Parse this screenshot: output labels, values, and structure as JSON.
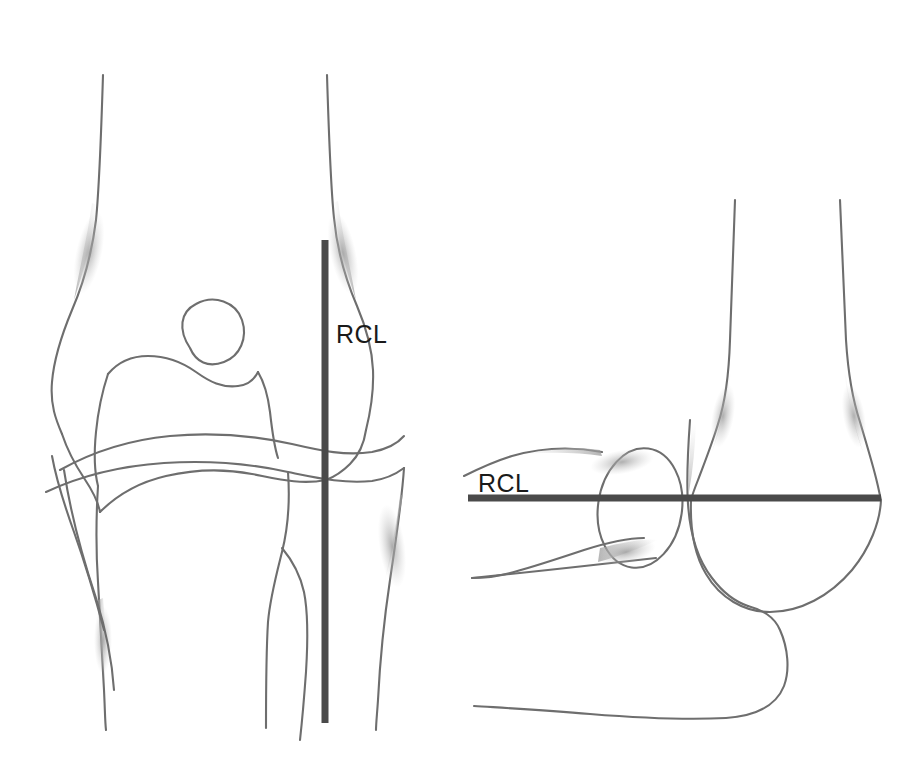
{
  "figure": {
    "background_color": "#ffffff",
    "outline_color": "#6e6e6e",
    "rcl_color": "#4a4a4a",
    "label_color": "#1a1a1a"
  },
  "panels": [
    {
      "id": "ap-view",
      "name": "anteroposterior-elbow-view",
      "label": "RCL",
      "label_position": {
        "x": 336,
        "y": 343
      },
      "rcl_orientation": "vertical",
      "rcl_line": {
        "x1": 325,
        "y1": 240,
        "x2": 325,
        "y2": 723
      }
    },
    {
      "id": "lateral-view",
      "name": "lateral-elbow-view",
      "label": "RCL",
      "label_position": {
        "x": 478,
        "y": 492
      },
      "rcl_orientation": "horizontal",
      "rcl_line": {
        "x1": 468,
        "y1": 498,
        "x2": 881,
        "y2": 498
      }
    }
  ],
  "labels": {
    "rcl_left": "RCL",
    "rcl_right": "RCL"
  }
}
